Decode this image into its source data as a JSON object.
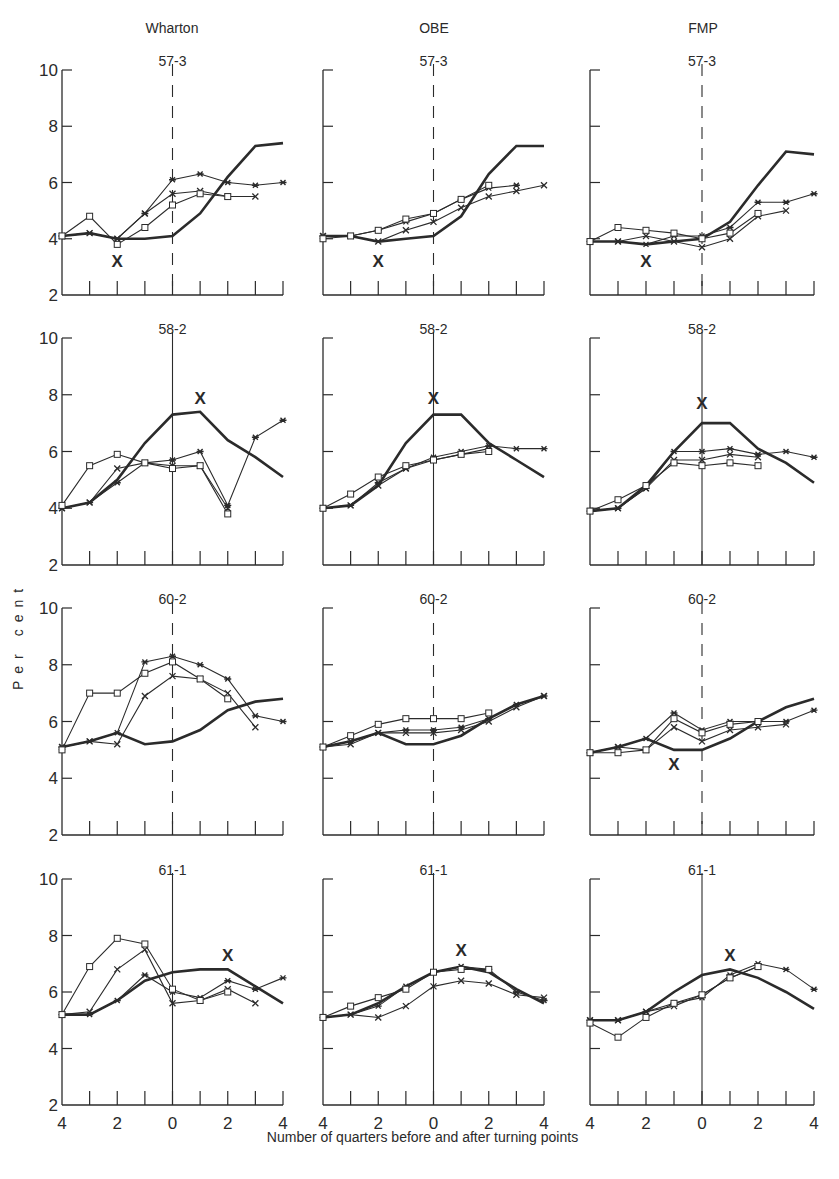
{
  "figure": {
    "ylabel": "Per cent",
    "xcaption": "Number of quarters before and after turning points",
    "columns": [
      "Wharton",
      "OBE",
      "FMP"
    ],
    "rows": [
      "57-3",
      "58-2",
      "60-2",
      "61-1"
    ],
    "y_ticks": [
      2,
      4,
      6,
      8,
      10
    ],
    "x_tick_labels": [
      "4",
      "2",
      "0",
      "2",
      "4"
    ],
    "line_color": "#2b2b2b"
  },
  "chart_data": {
    "type": "line",
    "xlabel": "Number of quarters before and after turning points",
    "ylabel": "Per cent",
    "x": [
      -4,
      -3,
      -2,
      -1,
      0,
      1,
      2,
      3,
      4
    ],
    "ylim": [
      2,
      10
    ],
    "grid": false,
    "legend": "none (series distinguished by markers: heavy line = actual, squares / crosses / stars = forecasts; large X = forecast turning point)",
    "panels": [
      {
        "model": "Wharton",
        "turning_point": "57-3",
        "zero_line": "dashed",
        "x_mark": [
          -2,
          3.2
        ],
        "series": [
          {
            "name": "Actual",
            "marker": "none",
            "values": [
              4.1,
              4.2,
              4.0,
              4.0,
              4.1,
              4.9,
              6.2,
              7.3,
              7.4
            ]
          },
          {
            "name": "Forecast A",
            "marker": "star",
            "values": [
              4.1,
              4.2,
              4.0,
              4.9,
              6.1,
              6.3,
              6.0,
              5.9,
              6.0
            ]
          },
          {
            "name": "Forecast B",
            "marker": "cross",
            "values": [
              4.1,
              4.2,
              4.0,
              4.9,
              5.6,
              5.7,
              5.5,
              5.5,
              null
            ]
          },
          {
            "name": "Forecast C",
            "marker": "square",
            "values": [
              4.1,
              4.8,
              3.8,
              4.4,
              5.2,
              5.6,
              5.5,
              null,
              null
            ]
          }
        ]
      },
      {
        "model": "OBE",
        "turning_point": "57-3",
        "zero_line": "dashed",
        "x_mark": [
          -2,
          3.2
        ],
        "series": [
          {
            "name": "Actual",
            "marker": "none",
            "values": [
              4.1,
              4.1,
              3.9,
              4.0,
              4.1,
              4.8,
              6.3,
              7.3,
              7.3
            ]
          },
          {
            "name": "Forecast A",
            "marker": "star",
            "values": [
              4.1,
              4.1,
              4.3,
              4.6,
              4.9,
              5.4,
              5.8,
              5.9,
              null
            ]
          },
          {
            "name": "Forecast B",
            "marker": "cross",
            "values": [
              4.1,
              4.1,
              3.9,
              4.3,
              4.6,
              5.1,
              5.5,
              5.7,
              5.9
            ]
          },
          {
            "name": "Forecast C",
            "marker": "square",
            "values": [
              4.0,
              4.1,
              4.3,
              4.7,
              4.9,
              5.4,
              5.9,
              null,
              null
            ]
          }
        ]
      },
      {
        "model": "FMP",
        "turning_point": "57-3",
        "zero_line": "dashed",
        "x_mark": [
          -2,
          3.2
        ],
        "series": [
          {
            "name": "Actual",
            "marker": "none",
            "values": [
              3.9,
              3.9,
              3.8,
              3.9,
              4.0,
              4.6,
              5.9,
              7.1,
              7.0
            ]
          },
          {
            "name": "Forecast A",
            "marker": "star",
            "values": [
              3.9,
              3.9,
              3.8,
              4.1,
              4.1,
              4.4,
              5.3,
              5.3,
              5.6
            ]
          },
          {
            "name": "Forecast B",
            "marker": "cross",
            "values": [
              3.9,
              3.9,
              4.1,
              3.9,
              3.7,
              4.0,
              4.8,
              5.0,
              null
            ]
          },
          {
            "name": "Forecast C",
            "marker": "square",
            "values": [
              3.9,
              4.4,
              4.3,
              4.2,
              4.0,
              4.2,
              4.9,
              null,
              null
            ]
          }
        ]
      },
      {
        "model": "Wharton",
        "turning_point": "58-2",
        "zero_line": "solid",
        "x_mark": [
          1,
          7.9
        ],
        "series": [
          {
            "name": "Actual",
            "marker": "none",
            "values": [
              4.0,
              4.2,
              5.0,
              6.3,
              7.3,
              7.4,
              6.4,
              5.8,
              5.1
            ]
          },
          {
            "name": "Forecast A",
            "marker": "star",
            "values": [
              4.0,
              4.2,
              4.9,
              5.6,
              5.7,
              6.0,
              4.1,
              6.5,
              7.1
            ]
          },
          {
            "name": "Forecast B",
            "marker": "cross",
            "values": [
              4.0,
              4.2,
              5.4,
              5.6,
              5.5,
              5.5,
              4.0,
              null,
              null
            ]
          },
          {
            "name": "Forecast C",
            "marker": "square",
            "values": [
              4.1,
              5.5,
              5.9,
              5.6,
              5.4,
              5.5,
              3.8,
              null,
              null
            ]
          }
        ]
      },
      {
        "model": "OBE",
        "turning_point": "58-2",
        "zero_line": "solid",
        "x_mark": [
          0,
          7.9
        ],
        "series": [
          {
            "name": "Actual",
            "marker": "none",
            "values": [
              4.0,
              4.1,
              4.8,
              6.3,
              7.3,
              7.3,
              6.3,
              5.7,
              5.1
            ]
          },
          {
            "name": "Forecast A",
            "marker": "star",
            "values": [
              4.0,
              4.1,
              4.9,
              5.4,
              5.8,
              6.0,
              6.2,
              6.1,
              6.1
            ]
          },
          {
            "name": "Forecast B",
            "marker": "cross",
            "values": [
              4.0,
              4.1,
              4.8,
              5.4,
              5.7,
              5.9,
              6.1,
              null,
              null
            ]
          },
          {
            "name": "Forecast C",
            "marker": "square",
            "values": [
              4.0,
              4.5,
              5.1,
              5.5,
              5.7,
              5.9,
              6.0,
              null,
              null
            ]
          }
        ]
      },
      {
        "model": "FMP",
        "turning_point": "58-2",
        "zero_line": "solid",
        "x_mark": [
          0,
          7.7
        ],
        "series": [
          {
            "name": "Actual",
            "marker": "none",
            "values": [
              3.9,
              4.0,
              4.8,
              6.0,
              7.0,
              7.0,
              6.1,
              5.6,
              4.9
            ]
          },
          {
            "name": "Forecast A",
            "marker": "star",
            "values": [
              3.9,
              4.0,
              4.7,
              6.0,
              6.0,
              6.1,
              5.9,
              6.0,
              5.8
            ]
          },
          {
            "name": "Forecast B",
            "marker": "cross",
            "values": [
              3.9,
              4.0,
              4.7,
              5.7,
              5.7,
              5.9,
              5.8,
              null,
              null
            ]
          },
          {
            "name": "Forecast C",
            "marker": "square",
            "values": [
              3.9,
              4.3,
              4.8,
              5.6,
              5.5,
              5.6,
              5.5,
              null,
              null
            ]
          }
        ]
      },
      {
        "model": "Wharton",
        "turning_point": "60-2",
        "zero_line": "dashed",
        "x_mark": null,
        "series": [
          {
            "name": "Actual",
            "marker": "none",
            "values": [
              5.1,
              5.3,
              5.6,
              5.2,
              5.3,
              5.7,
              6.4,
              6.7,
              6.8
            ]
          },
          {
            "name": "Forecast A",
            "marker": "star",
            "values": [
              5.1,
              5.3,
              5.6,
              8.1,
              8.3,
              8.0,
              7.5,
              6.2,
              6.0
            ]
          },
          {
            "name": "Forecast B",
            "marker": "cross",
            "values": [
              5.1,
              5.3,
              5.2,
              6.9,
              7.6,
              7.5,
              7.0,
              5.8,
              null
            ]
          },
          {
            "name": "Forecast C",
            "marker": "square",
            "values": [
              5.0,
              7.0,
              7.0,
              7.7,
              8.1,
              7.5,
              6.8,
              null,
              null
            ]
          }
        ]
      },
      {
        "model": "OBE",
        "turning_point": "60-2",
        "zero_line": "dashed",
        "x_mark": null,
        "series": [
          {
            "name": "Actual",
            "marker": "none",
            "values": [
              5.1,
              5.3,
              5.6,
              5.2,
              5.2,
              5.5,
              6.1,
              6.6,
              6.9
            ]
          },
          {
            "name": "Forecast A",
            "marker": "star",
            "values": [
              5.1,
              5.3,
              5.6,
              5.7,
              5.7,
              5.8,
              6.1,
              6.6,
              6.9
            ]
          },
          {
            "name": "Forecast B",
            "marker": "cross",
            "values": [
              5.1,
              5.2,
              5.6,
              5.6,
              5.6,
              5.7,
              6.0,
              6.5,
              6.9
            ]
          },
          {
            "name": "Forecast C",
            "marker": "square",
            "values": [
              5.1,
              5.5,
              5.9,
              6.1,
              6.1,
              6.1,
              6.3,
              null,
              null
            ]
          }
        ]
      },
      {
        "model": "FMP",
        "turning_point": "60-2",
        "zero_line": "dashed",
        "x_mark": [
          -1,
          4.5
        ],
        "series": [
          {
            "name": "Actual",
            "marker": "none",
            "values": [
              4.9,
              5.1,
              5.4,
              5.0,
              5.0,
              5.4,
              6.0,
              6.5,
              6.8
            ]
          },
          {
            "name": "Forecast A",
            "marker": "star",
            "values": [
              4.9,
              5.1,
              5.4,
              6.3,
              5.7,
              6.0,
              6.0,
              6.0,
              6.4
            ]
          },
          {
            "name": "Forecast B",
            "marker": "cross",
            "values": [
              4.9,
              5.1,
              5.0,
              5.8,
              5.3,
              5.7,
              5.8,
              5.9,
              null
            ]
          },
          {
            "name": "Forecast C",
            "marker": "square",
            "values": [
              4.9,
              4.9,
              5.0,
              6.1,
              5.6,
              5.9,
              6.0,
              null,
              null
            ]
          }
        ]
      },
      {
        "model": "Wharton",
        "turning_point": "61-1",
        "zero_line": "solid",
        "x_mark": [
          2,
          7.3
        ],
        "series": [
          {
            "name": "Actual",
            "marker": "none",
            "values": [
              5.2,
              5.2,
              5.7,
              6.4,
              6.7,
              6.8,
              6.8,
              6.2,
              5.6
            ]
          },
          {
            "name": "Forecast A",
            "marker": "star",
            "values": [
              5.2,
              5.2,
              5.7,
              6.6,
              6.0,
              5.8,
              6.4,
              6.1,
              6.5
            ]
          },
          {
            "name": "Forecast B",
            "marker": "cross",
            "values": [
              5.2,
              5.3,
              6.8,
              7.5,
              5.6,
              5.7,
              6.1,
              5.6,
              null
            ]
          },
          {
            "name": "Forecast C",
            "marker": "square",
            "values": [
              5.2,
              6.9,
              7.9,
              7.7,
              6.1,
              5.7,
              6.0,
              null,
              null
            ]
          }
        ]
      },
      {
        "model": "OBE",
        "turning_point": "61-1",
        "zero_line": "solid",
        "x_mark": [
          1,
          7.5
        ],
        "series": [
          {
            "name": "Actual",
            "marker": "none",
            "values": [
              5.1,
              5.2,
              5.6,
              6.2,
              6.7,
              6.9,
              6.7,
              6.1,
              5.6
            ]
          },
          {
            "name": "Forecast A",
            "marker": "star",
            "values": [
              5.1,
              5.2,
              5.5,
              6.2,
              6.7,
              6.9,
              6.8,
              6.0,
              5.7
            ]
          },
          {
            "name": "Forecast B",
            "marker": "cross",
            "values": [
              5.1,
              5.2,
              5.1,
              5.5,
              6.2,
              6.4,
              6.3,
              5.9,
              5.8
            ]
          },
          {
            "name": "Forecast C",
            "marker": "square",
            "values": [
              5.1,
              5.5,
              5.8,
              6.1,
              6.7,
              6.8,
              6.8,
              null,
              null
            ]
          }
        ]
      },
      {
        "model": "FMP",
        "turning_point": "61-1",
        "zero_line": "solid",
        "x_mark": [
          1,
          7.3
        ],
        "series": [
          {
            "name": "Actual",
            "marker": "none",
            "values": [
              5.0,
              5.0,
              5.3,
              6.0,
              6.6,
              6.8,
              6.5,
              6.0,
              5.4
            ]
          },
          {
            "name": "Forecast A",
            "marker": "star",
            "values": [
              5.0,
              5.0,
              5.3,
              5.6,
              5.8,
              6.6,
              7.0,
              6.8,
              6.1
            ]
          },
          {
            "name": "Forecast B",
            "marker": "cross",
            "values": [
              5.0,
              5.0,
              5.3,
              5.5,
              5.9,
              6.5,
              6.9,
              null,
              null
            ]
          },
          {
            "name": "Forecast C",
            "marker": "square",
            "values": [
              4.9,
              4.4,
              5.1,
              5.6,
              5.9,
              6.5,
              6.9,
              null,
              null
            ]
          }
        ]
      }
    ]
  }
}
